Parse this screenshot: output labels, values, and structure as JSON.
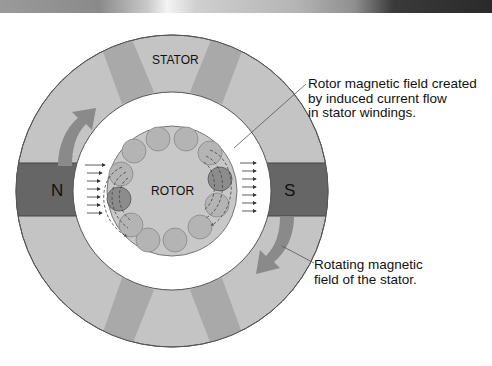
{
  "diagram": {
    "title_bar": "",
    "labels": {
      "stator": "STATOR",
      "rotor": "ROTOR",
      "north_pole": "N",
      "south_pole": "S"
    },
    "callouts": {
      "rotor_field": "Rotor magnetic field created\nby induced current flow\nin stator windings.",
      "stator_field": "Rotating magnetic\nfield of the stator."
    },
    "colors": {
      "stator_light": "#c4c4c4",
      "stator_segment": "#a9a9a9",
      "pole": "#666666",
      "arrow": "#8a8a8a",
      "rotor": "#c8c8c8",
      "rotor_bar": "#b4b4b4",
      "rotor_bar_active": "#8c8c8c",
      "background": "#ffffff"
    },
    "rotor_bar_count": 12
  }
}
